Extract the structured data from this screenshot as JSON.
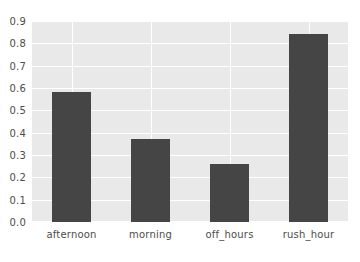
{
  "chart_data": {
    "type": "bar",
    "title": "",
    "subtitle": "",
    "xlabel": "",
    "ylabel": "",
    "categories": [
      "afternoon",
      "morning",
      "off_hours",
      "rush_hour"
    ],
    "values": [
      0.58,
      0.37,
      0.26,
      0.84
    ],
    "series": [
      {
        "name": "",
        "values": [
          0.58,
          0.37,
          0.26,
          0.84
        ]
      }
    ],
    "ylim": [
      0.0,
      0.9
    ],
    "xlim": [
      0,
      4
    ],
    "ytick_labels": [
      "0.0",
      "0.1",
      "0.2",
      "0.3",
      "0.4",
      "0.5",
      "0.6",
      "0.7",
      "0.8",
      "0.9"
    ],
    "ytick_values": [
      0.0,
      0.1,
      0.2,
      0.3,
      0.4,
      0.5,
      0.6,
      0.7,
      0.8,
      0.9
    ],
    "xtick_labels": [
      "afternoon",
      "morning",
      "off_hours",
      "rush_hour"
    ],
    "grid": true,
    "grid_axis": "both",
    "legend": null,
    "legend_position": "none",
    "annotations": [],
    "colors": {
      "bar": "#454545",
      "plot_background": "#e9e9e9",
      "figure_background": "#ffffff",
      "gridline": "#ffffff",
      "tick_label": "#4d4d4d"
    }
  }
}
